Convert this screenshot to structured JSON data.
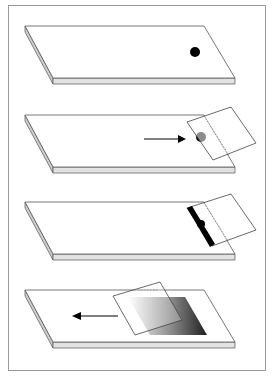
{
  "diagram": {
    "title": "",
    "colors": {
      "frame": "#9a9a9a",
      "outline": "#555555",
      "slide_top": "#ffffff",
      "slide_edge": "#dedede",
      "drop": "#000000",
      "arrow": "#000000",
      "smear_dark": "#2a2a2a",
      "smear_light": "#ffffff"
    },
    "steps": [
      {
        "id": 1,
        "label": "Place drop of blood on slide",
        "elements": [
          "slide",
          "drop"
        ]
      },
      {
        "id": 2,
        "label": "Spreader slide moved back to contact drop",
        "elements": [
          "slide",
          "drop",
          "spreader",
          "arrow-right"
        ]
      },
      {
        "id": 3,
        "label": "Blood spreads along edge of spreader",
        "elements": [
          "slide",
          "blood-line",
          "spreader"
        ]
      },
      {
        "id": 4,
        "label": "Spreader pushed forward to make smear",
        "elements": [
          "slide",
          "smear",
          "spreader",
          "arrow-left"
        ]
      }
    ]
  }
}
